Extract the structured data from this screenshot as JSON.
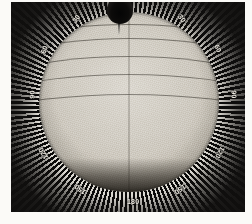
{
  "image": {
    "title": "Heliographic solar plate with radial degree scale",
    "subject": "solar-disk",
    "medium": "photographic-plate",
    "background_color": "#100f0e",
    "disk_color": "#cdc8be",
    "tick_light_color": "#e9e6df",
    "tick_dark_color": "#0b0a09",
    "label_color": "#f0ece3"
  },
  "scale": {
    "name": "position-angle-scale",
    "unit": "degrees",
    "tick_interval": 2.6,
    "labels": [
      {
        "text": "30",
        "x": 61,
        "y": 13,
        "rot": -56
      },
      {
        "text": "60",
        "x": 29,
        "y": 44,
        "rot": -68
      },
      {
        "text": "90",
        "x": 17,
        "y": 89,
        "rot": -88
      },
      {
        "text": "120",
        "x": 26,
        "y": 148,
        "rot": -120
      },
      {
        "text": "150",
        "x": 63,
        "y": 184,
        "rot": -144
      },
      {
        "text": "180",
        "x": 116,
        "y": 196,
        "rot": 0
      },
      {
        "text": "150",
        "x": 163,
        "y": 184,
        "rot": 144
      },
      {
        "text": "120",
        "x": 203,
        "y": 147,
        "rot": 120
      },
      {
        "text": "90",
        "x": 219,
        "y": 89,
        "rot": 88
      },
      {
        "text": "60",
        "x": 203,
        "y": 43,
        "rot": 64
      },
      {
        "text": "30",
        "x": 167,
        "y": 13,
        "rot": 52
      }
    ]
  },
  "disk": {
    "name": "solar-disk",
    "center_x": 118,
    "center_y": 100,
    "radius": 90,
    "latitude_lines": [
      {
        "label": "+60",
        "top": 12,
        "w": 300,
        "h": 86,
        "dir": "up"
      },
      {
        "label": "+45",
        "top": 26,
        "w": 330,
        "h": 100,
        "dir": "up"
      },
      {
        "label": "+30",
        "top": 44,
        "w": 360,
        "h": 112,
        "dir": "up"
      },
      {
        "label": "+15",
        "top": 62,
        "w": 400,
        "h": 122,
        "dir": "up"
      },
      {
        "label": "0",
        "top": 82,
        "w": 430,
        "h": 120,
        "dir": "up"
      },
      {
        "label": "-15",
        "top": 96,
        "w": 410,
        "h": 120,
        "dir": "down"
      },
      {
        "label": "-30",
        "top": 112,
        "w": 370,
        "h": 112,
        "dir": "down"
      },
      {
        "label": "-45",
        "top": 130,
        "w": 330,
        "h": 98,
        "dir": "down"
      },
      {
        "label": "-60",
        "top": 148,
        "w": 290,
        "h": 84,
        "dir": "down"
      }
    ]
  },
  "features": {
    "sunspot_group": {
      "name": "sunspot-group",
      "position": "top-centre",
      "x": 96,
      "y": -4
    }
  }
}
